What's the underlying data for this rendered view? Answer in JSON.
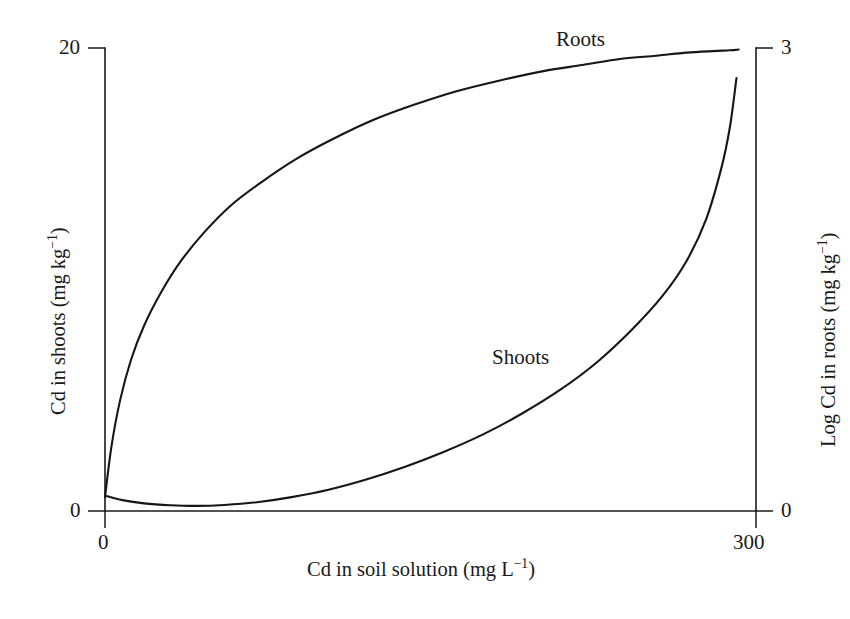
{
  "chart_data": {
    "type": "line",
    "title": "",
    "subtitle": "",
    "xlabel_parts": {
      "main": "Cd in soil solution (mg L",
      "exponent": "−1",
      "tail": ")"
    },
    "xlabel": "Cd in soil solution (mg L⁻¹)",
    "ylabel_left_parts": {
      "main": "Cd in shoots (mg kg",
      "exponent": "−1",
      "tail": ")"
    },
    "ylabel_left": "Cd in shoots (mg kg⁻¹)",
    "ylabel_right_parts": {
      "main": "Log Cd in roots (mg kg",
      "exponent": "−1",
      "tail": ")"
    },
    "ylabel_right": "Log Cd in roots (mg kg⁻¹)",
    "xlim": [
      0,
      300
    ],
    "ylim_left": [
      0,
      20
    ],
    "ylim_right": [
      0,
      3
    ],
    "xticks": [
      "0",
      "300"
    ],
    "yticks_left": [
      "0",
      "20"
    ],
    "yticks_right": [
      "0",
      "3"
    ],
    "grid": false,
    "legend": "inline-curve-labels",
    "line_color": "#161616",
    "axis_color": "#1a1a1a",
    "background": "#ffffff",
    "annotations": [
      {
        "text": "Roots",
        "x": 232,
        "y": 2.93
      },
      {
        "text": "Shoots",
        "x": 175,
        "y": 6.6
      }
    ],
    "series": [
      {
        "name": "Roots",
        "axis": "right",
        "units": "Log Cd in roots (mg kg⁻¹)",
        "x": [
          0,
          3,
          7,
          12,
          18,
          26,
          35,
          46,
          58,
          72,
          88,
          105,
          123,
          142,
          162,
          182,
          202,
          220,
          238,
          254,
          268,
          280,
          288,
          292
        ],
        "y": [
          0.09,
          0.42,
          0.72,
          0.98,
          1.2,
          1.42,
          1.62,
          1.81,
          1.98,
          2.13,
          2.28,
          2.41,
          2.53,
          2.63,
          2.72,
          2.79,
          2.85,
          2.89,
          2.93,
          2.95,
          2.97,
          2.98,
          2.985,
          2.99
        ]
      },
      {
        "name": "Shoots",
        "axis": "left",
        "units": "Cd in shoots (mg kg⁻¹)",
        "x": [
          0,
          8,
          18,
          30,
          42,
          55,
          70,
          86,
          103,
          120,
          138,
          156,
          174,
          192,
          210,
          227,
          243,
          257,
          268,
          277,
          284,
          288,
          291
        ],
        "y": [
          0.66,
          0.47,
          0.33,
          0.25,
          0.22,
          0.26,
          0.38,
          0.6,
          0.92,
          1.35,
          1.9,
          2.55,
          3.3,
          4.2,
          5.25,
          6.45,
          7.85,
          9.3,
          10.8,
          12.6,
          14.8,
          16.6,
          18.7
        ]
      }
    ]
  },
  "axes_geometry": {
    "plot_left": 105,
    "plot_right": 756,
    "plot_top": 48,
    "plot_bottom": 511
  }
}
